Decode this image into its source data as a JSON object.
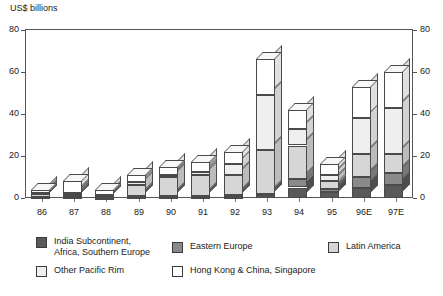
{
  "chart_data": {
    "type": "bar",
    "subtype": "stacked-3d-column",
    "title": "",
    "xlabel": "",
    "ylabel": "US$ billions",
    "y_axis_title": "US$ billions",
    "categories": [
      "86",
      "87",
      "88",
      "89",
      "90",
      "91",
      "92",
      "93",
      "94",
      "95",
      "96E",
      "97E"
    ],
    "ylim": [
      0,
      80
    ],
    "yticks": [
      0,
      20,
      40,
      60,
      80
    ],
    "ytick_labels": [
      "0",
      "20",
      "40",
      "60",
      "80"
    ],
    "right_axis": true,
    "right_yticks": [
      0,
      20,
      40,
      60,
      80
    ],
    "right_ytick_labels": [
      "0",
      "20",
      "40",
      "60",
      "80"
    ],
    "grid": false,
    "legend_position": "bottom",
    "series": [
      {
        "name": "India Subcontinent, Africa, Southern Europe",
        "color": "#595959",
        "values": [
          0.3,
          0.3,
          0.2,
          0.4,
          0.4,
          0.4,
          0.7,
          1.2,
          5.0,
          3.0,
          5.0,
          6.0
        ]
      },
      {
        "name": "Eastern Europe",
        "color": "#8a8a8a",
        "values": [
          0.2,
          0.2,
          0.2,
          0.4,
          0.4,
          0.4,
          0.6,
          0.8,
          4.0,
          1.5,
          5.0,
          6.0
        ]
      },
      {
        "name": "Latin America",
        "color": "#d6d6d6",
        "values": [
          1.5,
          1.0,
          0.6,
          5.2,
          9.2,
          10.2,
          9.7,
          21.0,
          16.0,
          3.5,
          11.0,
          9.0
        ]
      },
      {
        "name": "Other Pacific Rim",
        "color": "#efefef",
        "values": [
          0.5,
          1.0,
          0.5,
          1.5,
          1.0,
          1.5,
          5.0,
          26.0,
          8.0,
          3.0,
          17.0,
          22.0
        ]
      },
      {
        "name": "Hong Kong & China, Singapore",
        "color": "#ffffff",
        "values": [
          1.5,
          5.5,
          2.5,
          3.5,
          4.0,
          4.5,
          6.0,
          17.0,
          9.0,
          5.0,
          15.0,
          17.0
        ]
      }
    ],
    "totals": [
      4.0,
      8.0,
      4.0,
      11.0,
      15.0,
      17.0,
      22.0,
      66.0,
      42.0,
      16.0,
      53.0,
      60.0
    ]
  },
  "legend": {
    "items": [
      {
        "label": "India Subcontinent,\nAfrica, Southern Europe",
        "color": "#595959"
      },
      {
        "label": "Eastern Europe",
        "color": "#8a8a8a"
      },
      {
        "label": "Latin America",
        "color": "#d6d6d6"
      },
      {
        "label": "Other Pacific Rim",
        "color": "#efefef"
      },
      {
        "label": "Hong Kong & China, Singapore",
        "color": "#ffffff"
      }
    ]
  }
}
